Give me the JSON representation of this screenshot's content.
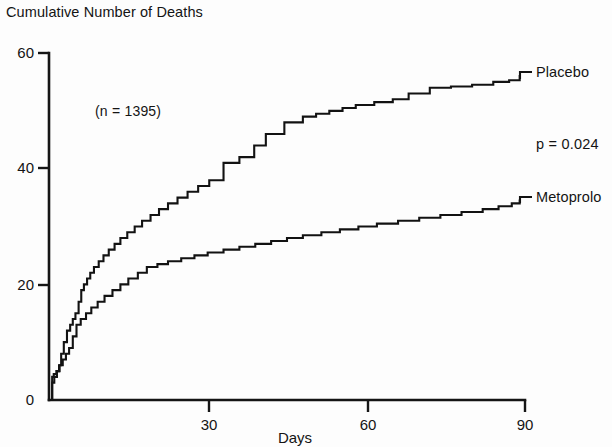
{
  "figure": {
    "title": "Cumulative Number of Deaths",
    "xaxis_title": "Days",
    "annotation_n": "(n = 1395)",
    "pvalue": "p = 0.024",
    "label_placebo": "Placebo",
    "label_metoprolol": "Metoprolo",
    "ytick_0": "0",
    "ytick_20": "20",
    "ytick_40": "40",
    "ytick_60": "60",
    "xtick_30": "30",
    "xtick_60": "60",
    "xtick_90": "90"
  },
  "chart_data": {
    "type": "line",
    "title": "Cumulative Number of Deaths",
    "xlabel": "Days",
    "ylabel": "Cumulative Number of Deaths",
    "xlim": [
      0,
      90
    ],
    "ylim": [
      0,
      60
    ],
    "xticks": [
      0,
      30,
      60,
      90
    ],
    "xtick_labels": [
      "",
      "30",
      "60",
      "90"
    ],
    "yticks": [
      0,
      20,
      40,
      60
    ],
    "ytick_labels": [
      "0",
      "20",
      "40",
      "60"
    ],
    "grid": false,
    "legend_position": "right-inline-labels",
    "line_color": "#121212",
    "annotations": [
      {
        "text": "(n = 1395)",
        "x": 9,
        "y": 51
      },
      {
        "text": "p = 0.024",
        "x": 92,
        "y": 45.5
      }
    ],
    "step_style": "post",
    "series": [
      {
        "name": "Placebo",
        "final_value": 56,
        "x": [
          0,
          0.6,
          0.9,
          1.4,
          1.9,
          2.3,
          2.8,
          3.4,
          4.0,
          4.5,
          5.0,
          5.6,
          6.1,
          6.6,
          7.2,
          7.8,
          8.5,
          9.4,
          10.3,
          11.3,
          12.4,
          13.5,
          14.8,
          16.2,
          17.6,
          19.2,
          20.8,
          22.5,
          24.3,
          26.2,
          28.2,
          30.3,
          33.0,
          36.0,
          38.8,
          41.0,
          44.5,
          48.0,
          50.5,
          53.0,
          55.5,
          58.0,
          61.5,
          65.0,
          68.0,
          72.0,
          76.0,
          80.0,
          84.0,
          87.0,
          89.0
        ],
        "values": [
          0,
          4,
          4.5,
          5,
          6,
          8,
          10,
          12,
          13,
          14,
          15,
          17,
          19,
          20,
          21,
          22,
          23,
          24,
          25,
          26,
          27,
          28,
          29,
          30,
          31,
          32,
          33,
          34,
          35,
          36,
          37,
          38,
          41,
          42,
          44,
          46,
          48,
          49,
          49.5,
          50,
          50.5,
          51,
          51.5,
          52,
          53,
          54,
          54.2,
          54.5,
          55,
          55.3,
          56
        ]
      },
      {
        "name": "Metoprolol",
        "final_value": 34.5,
        "x": [
          0,
          0.6,
          1.0,
          1.5,
          2.0,
          2.6,
          3.2,
          3.8,
          4.5,
          5.2,
          6.0,
          7.0,
          8.0,
          9.2,
          10.5,
          12.0,
          13.5,
          15.0,
          16.8,
          18.5,
          20.5,
          22.5,
          25.0,
          27.5,
          30.0,
          33.0,
          36.0,
          39.0,
          42.0,
          45.0,
          48.0,
          51.5,
          55.0,
          58.5,
          62.0,
          66.0,
          70.0,
          74.0,
          78.0,
          82.0,
          85.0,
          87.5,
          89.0
        ],
        "values": [
          0,
          3,
          4,
          5,
          6,
          7,
          8,
          9,
          11,
          13,
          14,
          15,
          16,
          17,
          18,
          19,
          20,
          21,
          22,
          23,
          23.5,
          24,
          24.5,
          25,
          25.5,
          26,
          26.5,
          27,
          27.5,
          28,
          28.5,
          29,
          29.5,
          30,
          30.5,
          31,
          31.5,
          32,
          32.5,
          33,
          33.5,
          34,
          34.5
        ]
      }
    ]
  }
}
